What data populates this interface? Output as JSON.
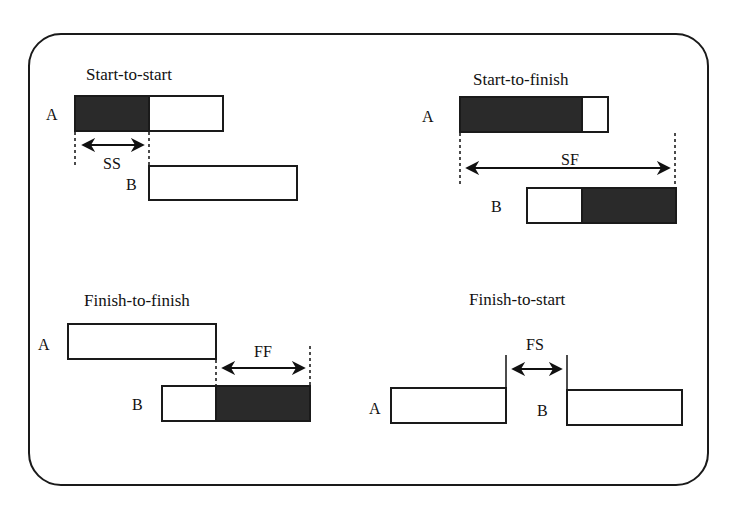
{
  "colors": {
    "frame": "#1a1a1a",
    "bar_outline": "#1a1a1a",
    "bar_fill_dark": "#2a2a2a",
    "bar_fill_light": "#ffffff",
    "background": "#ffffff"
  },
  "panels": [
    {
      "id": "start-to-start",
      "title": "Start-to-start",
      "lag_label": "SS",
      "activity_a": {
        "label": "A",
        "x": 75,
        "y": 96,
        "w": 148,
        "h": 35,
        "filled_from": 75,
        "filled_to": 149
      },
      "activity_b": {
        "label": "B",
        "x": 149,
        "y": 166,
        "w": 148,
        "h": 34,
        "filled_from": null,
        "filled_to": null
      }
    },
    {
      "id": "start-to-finish",
      "title": "Start-to-finish",
      "lag_label": "SF",
      "activity_a": {
        "label": "A",
        "x": 460,
        "y": 97,
        "w": 148,
        "h": 35,
        "filled_from": 460,
        "filled_to": 582
      },
      "activity_b": {
        "label": "B",
        "x": 527,
        "y": 188,
        "w": 149,
        "h": 35,
        "filled_from": 582,
        "filled_to": 676
      }
    },
    {
      "id": "finish-to-finish",
      "title": "Finish-to-finish",
      "lag_label": "FF",
      "activity_a": {
        "label": "A",
        "x": 68,
        "y": 324,
        "w": 148,
        "h": 35,
        "filled_from": null,
        "filled_to": null
      },
      "activity_b": {
        "label": "B",
        "x": 162,
        "y": 386,
        "w": 148,
        "h": 35,
        "filled_from": 216,
        "filled_to": 310
      }
    },
    {
      "id": "finish-to-start",
      "title": "Finish-to-start",
      "lag_label": "FS",
      "activity_a": {
        "label": "A",
        "x": 391,
        "y": 388,
        "w": 115,
        "h": 35,
        "filled_from": null,
        "filled_to": null
      },
      "activity_b": {
        "label": "B",
        "x": 567,
        "y": 390,
        "w": 115,
        "h": 35,
        "filled_from": null,
        "filled_to": null
      }
    }
  ]
}
